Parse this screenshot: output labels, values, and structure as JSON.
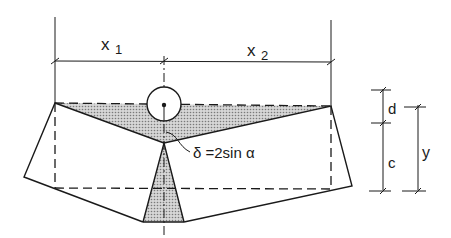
{
  "diagram": {
    "labels": {
      "x1": "x",
      "x1_sub": "1",
      "x2": "x",
      "x2_sub": "2",
      "d": "d",
      "c": "c",
      "y": "y",
      "formula": "δ =2sin α"
    },
    "colors": {
      "line": "#1a1a1a",
      "fill_shaded": "#b8b8b8",
      "background": "#ffffff"
    }
  }
}
